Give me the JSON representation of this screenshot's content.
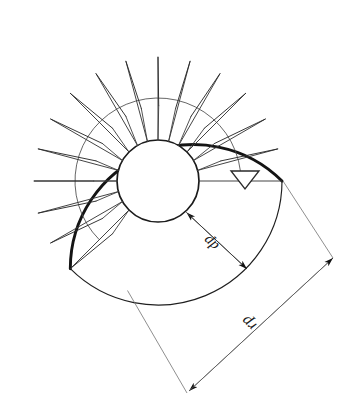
{
  "drawing": {
    "title": "Spiral staircase plan view",
    "type": "technical-line-drawing",
    "background_color": "#ffffff",
    "line_color": "#1a1a1a",
    "thin_line_color": "#555555",
    "canvas": {
      "width": 354,
      "height": 417
    },
    "center": {
      "x": 158,
      "y": 181
    },
    "geometry": {
      "outer_radius": 124,
      "middle_arc_radius": 83,
      "inner_circle_radius": 41,
      "tread_start_angle_deg": 0,
      "tread_end_angle_deg": 225,
      "tread_step_angle_deg": 15,
      "tread_count": 15
    },
    "labels": {
      "pole_diameter": "dp",
      "plan_radius": "rp"
    },
    "markers": {
      "datum_triangle": "level-datum-triangle",
      "start_line": "horizontal-start-line"
    },
    "dimension_lines": {
      "pole_diameter_dim": {
        "from": {
          "x": 186,
          "y": 212
        },
        "to": {
          "x": 247,
          "y": 269
        },
        "label": "dp"
      },
      "plan_radius_dim": {
        "from": {
          "x": 188,
          "y": 392
        },
        "to": {
          "x": 332,
          "y": 258
        },
        "label": "rp"
      },
      "extension_a": {
        "from": {
          "x": 283,
          "y": 181
        },
        "to": {
          "x": 332,
          "y": 258
        }
      },
      "extension_b": {
        "from": {
          "x": 128,
          "y": 290
        },
        "to": {
          "x": 188,
          "y": 392
        }
      }
    }
  }
}
